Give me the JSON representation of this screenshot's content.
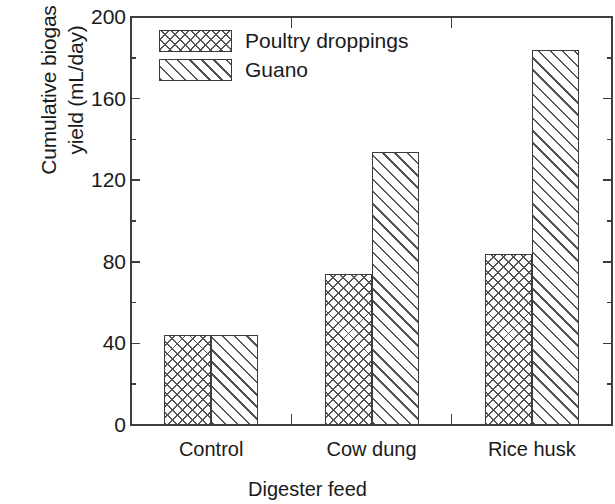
{
  "chart_data": {
    "type": "bar",
    "title": "",
    "xlabel": "Digester feed",
    "ylabel": "Cumulative biogas yield (mL/day)",
    "ylabel_line1": "Cumulative biogas",
    "ylabel_line2": "yield (mL/day)",
    "categories": [
      "Control",
      "Cow dung",
      "Rice husk"
    ],
    "series": [
      {
        "name": "Poultry droppings",
        "values": [
          44,
          74,
          84
        ],
        "pattern": "crosshatch"
      },
      {
        "name": "Guano",
        "values": [
          44,
          134,
          184
        ],
        "pattern": "diagonal-hatch"
      }
    ],
    "ylim": [
      0,
      200
    ],
    "ytick_labels": [
      "0",
      "40",
      "80",
      "120",
      "160",
      "200"
    ],
    "ytick_values": [
      0,
      40,
      80,
      120,
      160,
      200
    ],
    "yminor_values": [
      20,
      60,
      100,
      140,
      180
    ],
    "grid": false,
    "legend_position": "top-left-inside",
    "frame": "box",
    "tick_direction": "in",
    "colors": {
      "axis": "#3d3d3d",
      "text": "#1a1a1a",
      "hatch": "#555555",
      "background": "#ffffff"
    }
  },
  "legend": {
    "items": [
      {
        "label": "Poultry droppings"
      },
      {
        "label": "Guano"
      }
    ]
  }
}
